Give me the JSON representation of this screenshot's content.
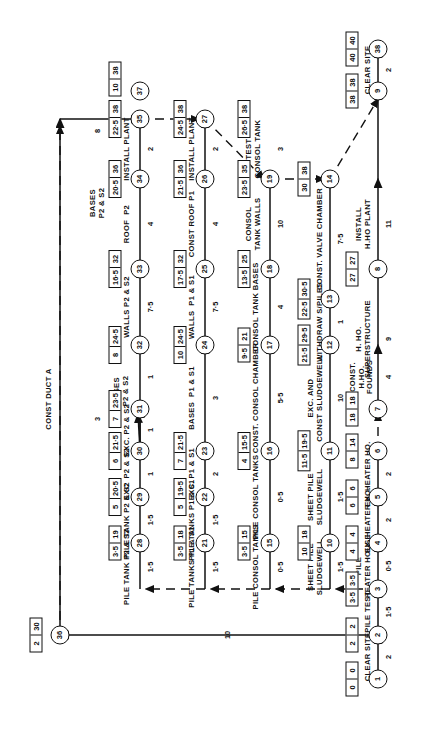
{
  "diagram": {
    "type": "cpm-network-arrow-diagram",
    "orientation": "page rotated 90 degrees (read sideways)",
    "box_note": "Each boxed pair shows earliest event time | latest event time",
    "events": [
      {
        "id": "1",
        "early": "0",
        "late": "0"
      },
      {
        "id": "2",
        "early": "2",
        "late": "2"
      },
      {
        "id": "3",
        "early": "3·5",
        "late": "3·5"
      },
      {
        "id": "4",
        "early": "4",
        "late": "4"
      },
      {
        "id": "5",
        "early": "6",
        "late": "6"
      },
      {
        "id": "6",
        "early": "8",
        "late": "14"
      },
      {
        "id": "7",
        "early": "18",
        "late": "18"
      },
      {
        "id": "8",
        "early": "27",
        "late": "27"
      },
      {
        "id": "9",
        "early": "38",
        "late": "38"
      },
      {
        "id": "10",
        "early": "10",
        "late": "18"
      },
      {
        "id": "11",
        "early": "11·5",
        "late": "19·5"
      },
      {
        "id": "12",
        "early": "21·5",
        "late": "29·5"
      },
      {
        "id": "13",
        "early": "22·5",
        "late": "30·5"
      },
      {
        "id": "14",
        "early": "30",
        "late": "38"
      },
      {
        "id": "15",
        "early": "3·5",
        "late": "15"
      },
      {
        "id": "16",
        "early": "4",
        "late": "15·5"
      },
      {
        "id": "17",
        "early": "9·5",
        "late": "21"
      },
      {
        "id": "18",
        "early": "13·5",
        "late": "25"
      },
      {
        "id": "19",
        "early": "23·5",
        "late": "35"
      },
      {
        "id": "20",
        "early": "26·5",
        "late": "38"
      },
      {
        "id": "21",
        "early": "3·5",
        "late": "18"
      },
      {
        "id": "22",
        "early": "5",
        "late": "19·5"
      },
      {
        "id": "23",
        "early": "7",
        "late": "21·5"
      },
      {
        "id": "24",
        "early": "10",
        "late": "24·5"
      },
      {
        "id": "25",
        "early": "17·5",
        "late": "32"
      },
      {
        "id": "26",
        "early": "21·5",
        "late": "36"
      },
      {
        "id": "27",
        "early": "24·5",
        "late": "38"
      },
      {
        "id": "28",
        "early": "3·5",
        "late": "19"
      },
      {
        "id": "29",
        "early": "5",
        "late": "20·5"
      },
      {
        "id": "30",
        "early": "6",
        "late": "21·5"
      },
      {
        "id": "31",
        "early": "7",
        "late": "23·5"
      },
      {
        "id": "32",
        "early": "8",
        "late": "24·5"
      },
      {
        "id": "33",
        "early": "16·5",
        "late": "32"
      },
      {
        "id": "34",
        "early": "20·5",
        "late": "36"
      },
      {
        "id": "35",
        "early": "22·5",
        "late": "38"
      },
      {
        "id": "36",
        "early": "2",
        "late": "30"
      },
      {
        "id": "37",
        "early": "10",
        "late": "38"
      },
      {
        "id": "38",
        "early": "40",
        "late": "40"
      }
    ],
    "activities": [
      {
        "from": "1",
        "to": "2",
        "label": "CLEAR SITE",
        "duration": "2"
      },
      {
        "from": "2",
        "to": "3",
        "label": "PILE TEST",
        "duration": "1·5"
      },
      {
        "from": "3",
        "to": "4",
        "label": "PILE\nHEATER HOUSE",
        "duration": "0·5"
      },
      {
        "from": "4",
        "to": "5",
        "label": "EX. HEATER HO.",
        "duration": "2"
      },
      {
        "from": "5",
        "to": "6",
        "label": "EX. HEATER HO.",
        "duration": "2"
      },
      {
        "from": "6",
        "to": "7",
        "label": "CONST.\nH.HO.\nFOUNDS",
        "duration": "4"
      },
      {
        "from": "7",
        "to": "8",
        "label": "H. HO.\nSUPERSTRUCTURE",
        "duration": "9"
      },
      {
        "from": "8",
        "to": "9",
        "label": "INSTALL\nH.HO PLANT",
        "duration": "11"
      },
      {
        "from": "9",
        "to": "38",
        "label": "CLEAR SITE",
        "duration": "2"
      },
      {
        "from": "3",
        "to": "10",
        "label": "SHEET PILE\nSLUDGEWELL",
        "duration": "1·5"
      },
      {
        "from": "10",
        "to": "11",
        "label": "SHEET PILE\nSLUDGEWELL",
        "duration": "1·5"
      },
      {
        "from": "11",
        "to": "12",
        "label": "EXC. AND\nCONST SLUDGEWELL",
        "duration": "10"
      },
      {
        "from": "12",
        "to": "13",
        "label": "WITHDRAW S/PILES",
        "duration": "1"
      },
      {
        "from": "13",
        "to": "14",
        "label": "CONST. VALVE CHAMBER",
        "duration": "7·5"
      },
      {
        "from": "3",
        "to": "15",
        "label": "PILE CONSOL TANKS",
        "duration": "0·5"
      },
      {
        "from": "15",
        "to": "16",
        "label": "PILE CONSOL TANKS",
        "duration": "0·5"
      },
      {
        "from": "16",
        "to": "17",
        "label": "CONST. CONSOL CHAMBER",
        "duration": "5·5"
      },
      {
        "from": "17",
        "to": "18",
        "label": "CONSOL TANK BASES",
        "duration": "4"
      },
      {
        "from": "18",
        "to": "19",
        "label": "CONSOL\nTANK WALLS",
        "duration": "10"
      },
      {
        "from": "19",
        "to": "20",
        "label": "TEST\nCONSOL TANK",
        "duration": "3"
      },
      {
        "from": "3",
        "to": "21",
        "label": "PILE TANKS P1 & S1",
        "duration": "1·5"
      },
      {
        "from": "21",
        "to": "22",
        "label": "PILE TANKS P1 & S1",
        "duration": "1·5"
      },
      {
        "from": "22",
        "to": "23",
        "label": "EXC. P1 & S1",
        "duration": "2"
      },
      {
        "from": "23",
        "to": "24",
        "label": "BASES  P1 & S1",
        "duration": "3"
      },
      {
        "from": "24",
        "to": "25",
        "label": "WALLS  P1 & S1",
        "duration": "7·5"
      },
      {
        "from": "25",
        "to": "26",
        "label": "CONST ROOF P1",
        "duration": "4"
      },
      {
        "from": "26",
        "to": "27",
        "label": "INSTALL PLANT",
        "duration": "2"
      },
      {
        "from": "3",
        "to": "28",
        "label": "PILE TANK P2 & S2",
        "duration": "1·5"
      },
      {
        "from": "28",
        "to": "29",
        "label": "PILE TANK P2 & S2",
        "duration": "1·5"
      },
      {
        "from": "29",
        "to": "30",
        "label": "EXC  P2 & S2",
        "duration": "1"
      },
      {
        "from": "30",
        "to": "31",
        "label": "EXC. P2 & S2",
        "duration": "1"
      },
      {
        "from": "31",
        "to": "32",
        "label": "BASES\nP2 & S2",
        "duration": "1"
      },
      {
        "from": "32",
        "to": "33",
        "label": "WALLS P2 & S2",
        "duration": "7·5"
      },
      {
        "from": "33",
        "to": "34",
        "label": "ROOF  P2",
        "duration": "4"
      },
      {
        "from": "34",
        "to": "35",
        "label": "INSTALL PLANT",
        "duration": "2"
      },
      {
        "from": "2",
        "to": "36",
        "label": "CONST DUCT A",
        "duration": "10"
      },
      {
        "from": "36",
        "to": "32",
        "label": "BASES\nP2 & S2",
        "duration": "8"
      },
      {
        "from": "30",
        "to": "32",
        "label": "",
        "duration": "3"
      }
    ],
    "dummies": [
      {
        "from": "3",
        "to": "15"
      },
      {
        "from": "15",
        "to": "21"
      },
      {
        "from": "21",
        "to": "28"
      },
      {
        "from": "14",
        "to": "9"
      },
      {
        "from": "20",
        "to": "14"
      },
      {
        "from": "27",
        "to": "20"
      },
      {
        "from": "35",
        "to": "27"
      },
      {
        "from": "37",
        "to": "35"
      },
      {
        "from": "36",
        "to": "37"
      },
      {
        "from": "6",
        "to": "7"
      }
    ]
  }
}
